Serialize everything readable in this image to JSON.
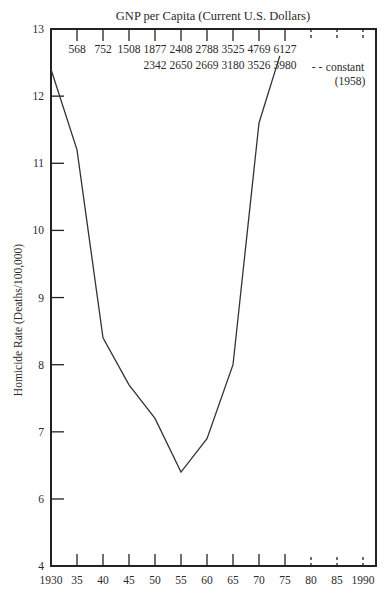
{
  "chart_data": {
    "type": "line",
    "title": "GNP per Capita (Current U.S. Dollars)",
    "xlabel": "",
    "ylabel": "Homicide Rate (Deaths/100,000)",
    "x": [
      1930,
      1935,
      1940,
      1945,
      1950,
      1955,
      1960,
      1965,
      1970,
      1974
    ],
    "series": [
      {
        "name": "Homicide Rate",
        "values": [
          12.4,
          11.2,
          8.4,
          7.7,
          7.2,
          6.4,
          6.9,
          8.0,
          11.6,
          12.6
        ]
      }
    ],
    "xlim": [
      1930,
      1990
    ],
    "ylim": [
      4,
      13
    ],
    "y_ticks": [
      "4",
      "6",
      "7",
      "8",
      "9",
      "10",
      "11",
      "12",
      "13"
    ],
    "y_axis_note": "axis broken between 4 and 6",
    "x_tick_labels": [
      "1930",
      "35",
      "40",
      "45",
      "50",
      "55",
      "60",
      "65",
      "70",
      "75",
      "80",
      "85",
      "1990"
    ],
    "dashed_x_ticks": [
      "80",
      "85",
      "1990"
    ],
    "top_axis": {
      "title": "GNP per Capita (Current U.S. Dollars)",
      "current_dollars": [
        {
          "year": "35",
          "value": "568"
        },
        {
          "year": "40",
          "value": "752"
        },
        {
          "year": "45",
          "value": "1508"
        },
        {
          "year": "50",
          "value": "1877"
        },
        {
          "year": "55",
          "value": "2408"
        },
        {
          "year": "60",
          "value": "2788"
        },
        {
          "year": "65",
          "value": "3525"
        },
        {
          "year": "70",
          "value": "4769"
        },
        {
          "year": "75",
          "value": "6127"
        }
      ],
      "constant_dollars": [
        {
          "year": "50",
          "value": "2342"
        },
        {
          "year": "55",
          "value": "2650"
        },
        {
          "year": "60",
          "value": "2669"
        },
        {
          "year": "65",
          "value": "3180"
        },
        {
          "year": "70",
          "value": "3526"
        },
        {
          "year": "75",
          "value": "3980"
        }
      ],
      "constant_note": "constant",
      "constant_year": "(1958)",
      "dashes": "- -"
    },
    "grid": false,
    "legend": "none"
  }
}
